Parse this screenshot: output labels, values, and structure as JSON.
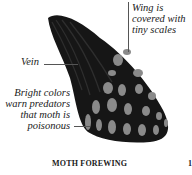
{
  "diagram": {
    "subject": "Moth forewing",
    "caption": "MOTH FOREWING",
    "cut_off_char": "1",
    "labels": {
      "scales": [
        "Wing is",
        "covered with",
        "tiny scales"
      ],
      "vein": "Vein",
      "colors": [
        "Bright colors",
        "warn predators",
        "that moth is",
        "poisonous"
      ]
    },
    "colors": {
      "wing": "#161616",
      "spots": "#8a8a8a",
      "vein": "#2e2e2e",
      "leader": "#555555"
    }
  }
}
